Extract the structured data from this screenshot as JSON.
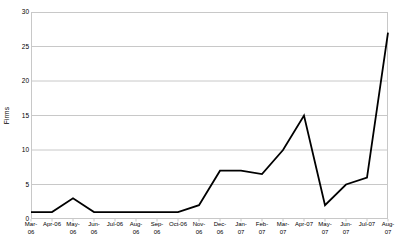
{
  "chart_data": {
    "type": "line",
    "title": "",
    "xlabel": "",
    "ylabel": "Firms",
    "ylim": [
      0,
      30
    ],
    "ytick_values": [
      0,
      5,
      10,
      15,
      20,
      25,
      30
    ],
    "ytick_labels": [
      "0",
      "5",
      "10",
      "15",
      "20",
      "25",
      "30"
    ],
    "grid": true,
    "grid_axis": "y",
    "legend": false,
    "legend_position": "none",
    "categories": [
      "Mar-06",
      "Apr-06",
      "May-06",
      "Jun-06",
      "Jul-06",
      "Aug-06",
      "Sep-06",
      "Oct-06",
      "Nov-06",
      "Dec-06",
      "Jan-07",
      "Feb-07",
      "Mar-07",
      "Apr-07",
      "May-07",
      "Jun-07",
      "Jul-07",
      "Aug-07"
    ],
    "category_labels": [
      "Mar-\n06",
      "Apr-06",
      "May-\n06",
      "Jun-\n06",
      "Jul-06",
      "Aug-\n06",
      "Sep-\n06",
      "Oct-06",
      "Nov-\n06",
      "Dec-\n06",
      "Jan-\n07",
      "Feb-\n07",
      "Mar-\n07",
      "Apr-07",
      "May-\n07",
      "Jun-\n07",
      "Jul-07",
      "Aug-\n07"
    ],
    "series": [
      {
        "name": "Firms",
        "color": "#000000",
        "values": [
          1,
          1,
          3,
          1,
          1,
          1,
          1,
          1,
          2,
          7,
          7,
          6.5,
          10,
          15,
          2,
          5,
          6,
          27
        ]
      }
    ]
  },
  "style": {
    "line_color": "#1a1a1a",
    "grid_color": "#c8c8c8",
    "frame_color": "#c8c8c8",
    "background": "#ffffff",
    "text_color": "#000000"
  }
}
